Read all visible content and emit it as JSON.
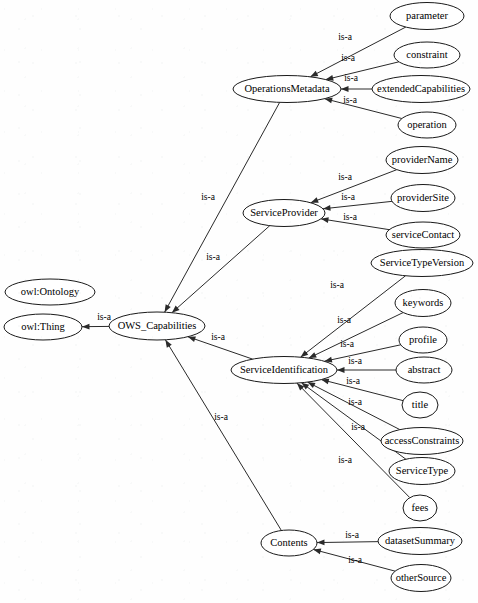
{
  "diagram": {
    "type": "ontology-class-hierarchy",
    "edge_relation_label": "is-a",
    "colors": {
      "background": "#fefefe",
      "node_fill": "#ffffff",
      "node_stroke": "#1a1a1a",
      "edge_stroke": "#2a2a2a",
      "text": "#000000"
    },
    "nodes": [
      {
        "id": "owl_ontology",
        "label": "owl:Ontology",
        "cx": 50,
        "cy": 292,
        "rx": 45,
        "ry": 13,
        "fs": 10.5
      },
      {
        "id": "owl_thing",
        "label": "owl:Thing",
        "cx": 43,
        "cy": 327,
        "rx": 39,
        "ry": 13,
        "fs": 10.5
      },
      {
        "id": "ows_capabilities",
        "label": "OWS_Capabilities",
        "cx": 157,
        "cy": 326,
        "rx": 48,
        "ry": 14,
        "fs": 10.5
      },
      {
        "id": "operations_metadata",
        "label": "OperationsMetadata",
        "cx": 287,
        "cy": 89,
        "rx": 54,
        "ry": 13.5,
        "fs": 10.5
      },
      {
        "id": "parameter",
        "label": "parameter",
        "cx": 427,
        "cy": 16,
        "rx": 37,
        "ry": 13.5,
        "fs": 10.5
      },
      {
        "id": "constraint",
        "label": "constraint",
        "cx": 427,
        "cy": 55,
        "rx": 33,
        "ry": 13,
        "fs": 10.5
      },
      {
        "id": "extended_capabilities",
        "label": "extendedCapabilities",
        "cx": 421,
        "cy": 89,
        "rx": 49,
        "ry": 13.5,
        "fs": 10.5
      },
      {
        "id": "operation",
        "label": "operation",
        "cx": 427,
        "cy": 125,
        "rx": 29,
        "ry": 13,
        "fs": 10.5
      },
      {
        "id": "service_provider",
        "label": "ServiceProvider",
        "cx": 284,
        "cy": 213,
        "rx": 41,
        "ry": 13.5,
        "fs": 10.5
      },
      {
        "id": "provider_name",
        "label": "providerName",
        "cx": 422,
        "cy": 160,
        "rx": 36,
        "ry": 13.5,
        "fs": 10.5
      },
      {
        "id": "provider_site",
        "label": "providerSite",
        "cx": 423,
        "cy": 198,
        "rx": 32,
        "ry": 13.5,
        "fs": 10.5
      },
      {
        "id": "service_contact",
        "label": "serviceContact",
        "cx": 423,
        "cy": 235,
        "rx": 37,
        "ry": 13,
        "fs": 10.5
      },
      {
        "id": "service_identification",
        "label": "ServiceIdentification",
        "cx": 284,
        "cy": 370,
        "rx": 53,
        "ry": 13.5,
        "fs": 10.5
      },
      {
        "id": "service_type_version",
        "label": "ServiceTypeVersion",
        "cx": 422,
        "cy": 263,
        "rx": 51,
        "ry": 13.5,
        "fs": 10.5
      },
      {
        "id": "keywords",
        "label": "keywords",
        "cx": 423,
        "cy": 303,
        "rx": 28,
        "ry": 13.5,
        "fs": 10.5
      },
      {
        "id": "profile",
        "label": "profile",
        "cx": 423,
        "cy": 340,
        "rx": 24,
        "ry": 13,
        "fs": 10.5
      },
      {
        "id": "abstract",
        "label": "abstract",
        "cx": 424,
        "cy": 370,
        "rx": 28,
        "ry": 13,
        "fs": 10.5
      },
      {
        "id": "title",
        "label": "title",
        "cx": 420,
        "cy": 405,
        "rx": 18,
        "ry": 13,
        "fs": 10.5
      },
      {
        "id": "access_constraints",
        "label": "accessConstraints",
        "cx": 422,
        "cy": 441,
        "rx": 41,
        "ry": 13.5,
        "fs": 10.5
      },
      {
        "id": "service_type",
        "label": "ServiceType",
        "cx": 422,
        "cy": 471,
        "rx": 33,
        "ry": 13.5,
        "fs": 10.5
      },
      {
        "id": "fees",
        "label": "fees",
        "cx": 420,
        "cy": 508,
        "rx": 17,
        "ry": 13,
        "fs": 10.5
      },
      {
        "id": "contents",
        "label": "Contents",
        "cx": 289,
        "cy": 543,
        "rx": 28,
        "ry": 13,
        "fs": 10.5
      },
      {
        "id": "dataset_summary",
        "label": "datasetSummary",
        "cx": 420,
        "cy": 541,
        "rx": 42,
        "ry": 13.5,
        "fs": 10.5
      },
      {
        "id": "other_source",
        "label": "otherSource",
        "cx": 421,
        "cy": 578,
        "rx": 30,
        "ry": 13.5,
        "fs": 10.5
      }
    ],
    "edges": [
      {
        "id": "e-ows-thing",
        "from": "ows_capabilities",
        "to": "owl_thing",
        "label": "is-a",
        "lx": 104,
        "ly": 318
      },
      {
        "id": "e-opsmd-ows",
        "from": "operations_metadata",
        "to": "ows_capabilities",
        "label": "is-a",
        "lx": 208,
        "ly": 198
      },
      {
        "id": "e-svcprov-ows",
        "from": "service_provider",
        "to": "ows_capabilities",
        "label": "is-a",
        "lx": 213,
        "ly": 258
      },
      {
        "id": "e-svcid-ows",
        "from": "service_identification",
        "to": "ows_capabilities",
        "label": "is-a",
        "lx": 218,
        "ly": 338
      },
      {
        "id": "e-contents-ows",
        "from": "contents",
        "to": "ows_capabilities",
        "label": "is-a",
        "lx": 221,
        "ly": 418
      },
      {
        "id": "e-param-opsmd",
        "from": "parameter",
        "to": "operations_metadata",
        "label": "is-a",
        "lx": 345,
        "ly": 38
      },
      {
        "id": "e-constr-opsmd",
        "from": "constraint",
        "to": "operations_metadata",
        "label": "is-a",
        "lx": 348,
        "ly": 59
      },
      {
        "id": "e-extcap-opsmd",
        "from": "extended_capabilities",
        "to": "operations_metadata",
        "label": "is-a",
        "lx": 351,
        "ly": 79
      },
      {
        "id": "e-oper-opsmd",
        "from": "operation",
        "to": "operations_metadata",
        "label": "is-a",
        "lx": 350,
        "ly": 101
      },
      {
        "id": "e-provname-sp",
        "from": "provider_name",
        "to": "service_provider",
        "label": "is-a",
        "lx": 345,
        "ly": 178
      },
      {
        "id": "e-provsite-sp",
        "from": "provider_site",
        "to": "service_provider",
        "label": "is-a",
        "lx": 348,
        "ly": 198
      },
      {
        "id": "e-svccont-sp",
        "from": "service_contact",
        "to": "service_provider",
        "label": "is-a",
        "lx": 350,
        "ly": 218
      },
      {
        "id": "e-stv-svcid",
        "from": "service_type_version",
        "to": "service_identification",
        "label": "is-a",
        "lx": 337,
        "ly": 286
      },
      {
        "id": "e-keyw-svcid",
        "from": "keywords",
        "to": "service_identification",
        "label": "is-a",
        "lx": 344,
        "ly": 321
      },
      {
        "id": "e-prof-svcid",
        "from": "profile",
        "to": "service_identification",
        "label": "is-a",
        "lx": 347,
        "ly": 345
      },
      {
        "id": "e-abs-svcid",
        "from": "abstract",
        "to": "service_identification",
        "label": "is-a",
        "lx": 355,
        "ly": 362
      },
      {
        "id": "e-title-svcid",
        "from": "title",
        "to": "service_identification",
        "label": "is-a",
        "lx": 353,
        "ly": 382
      },
      {
        "id": "e-acc-svcid",
        "from": "access_constraints",
        "to": "service_identification",
        "label": "is-a",
        "lx": 355,
        "ly": 403
      },
      {
        "id": "e-stype-svcid",
        "from": "service_type",
        "to": "service_identification",
        "label": "is-a",
        "lx": 358,
        "ly": 428
      },
      {
        "id": "e-fees-svcid",
        "from": "fees",
        "to": "service_identification",
        "label": "is-a",
        "lx": 345,
        "ly": 461
      },
      {
        "id": "e-ds-contents",
        "from": "dataset_summary",
        "to": "contents",
        "label": "is-a",
        "lx": 352,
        "ly": 536
      },
      {
        "id": "e-os-contents",
        "from": "other_source",
        "to": "contents",
        "label": "is-a",
        "lx": 355,
        "ly": 561
      }
    ]
  }
}
